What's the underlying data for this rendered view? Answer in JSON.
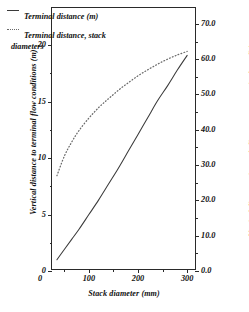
{
  "chart_data": {
    "type": "line",
    "title": "",
    "xlabel": "Stack diameter (mm)",
    "ylabel": "Vertical distance to terminal flow conditions (m)",
    "ylabel_right": "Vertical distance, in stack diameters, to terminal conditions",
    "xlim": [
      25,
      320
    ],
    "ylim": [
      0,
      23.3
    ],
    "ylim_right": [
      0,
      74.5
    ],
    "grid": false,
    "legend_position": "top-left",
    "xticks": [
      50,
      100,
      150,
      200,
      250,
      300
    ],
    "xtick_labels": [
      "",
      "100",
      "",
      "200",
      "",
      "300"
    ],
    "yticks_left": [
      0,
      2.5,
      5,
      7.5,
      10,
      12.5,
      15,
      17.5,
      20
    ],
    "ytick_labels_left": [
      "0",
      "",
      "5",
      "",
      "10",
      "",
      "15",
      "",
      "20"
    ],
    "yticks_right": [
      0,
      5,
      10,
      15,
      20,
      25,
      30,
      35,
      40,
      45,
      50,
      55,
      60,
      65,
      70
    ],
    "ytick_labels_right": [
      "0.0",
      "",
      "10.0",
      "",
      "20.0",
      "",
      "30.0",
      "",
      "40.0",
      "",
      "50.0",
      "",
      "60.0",
      "",
      "70.0"
    ],
    "series": [
      {
        "name": "Terminal distance (m)",
        "style": "solid",
        "color": "#3a3a3a",
        "axis": "left",
        "x": [
          35,
          50,
          65,
          80,
          100,
          120,
          140,
          160,
          180,
          200,
          220,
          240,
          260,
          280,
          300
        ],
        "values": [
          1.0,
          1.9,
          2.8,
          3.7,
          5.0,
          6.3,
          7.7,
          9.1,
          10.6,
          12.1,
          13.6,
          15.1,
          16.4,
          17.8,
          19.1
        ]
      },
      {
        "name": "Terminal distance, stack diameters",
        "style": "dotted",
        "color": "#6a6a6a",
        "axis": "right",
        "x": [
          35,
          50,
          65,
          80,
          100,
          120,
          140,
          160,
          180,
          200,
          220,
          240,
          260,
          280,
          300
        ],
        "values": [
          27.0,
          32.5,
          36.5,
          39.8,
          43.3,
          46.3,
          48.8,
          51.2,
          53.3,
          55.3,
          57.0,
          58.6,
          60.0,
          61.2,
          62.2
        ]
      }
    ]
  },
  "legend": {
    "items": [
      {
        "label": "Terminal distance (m)",
        "continuation": ""
      },
      {
        "label": "Terminal distance, stack",
        "continuation": "diameters"
      }
    ]
  }
}
